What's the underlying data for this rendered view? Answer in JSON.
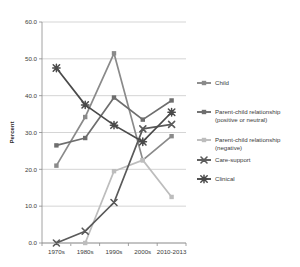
{
  "chart_data": {
    "type": "line",
    "title": "",
    "xlabel": "",
    "ylabel": "Percent",
    "categories": [
      "1970s",
      "1980s",
      "1990s",
      "2000s",
      "2010-2013"
    ],
    "ylim": [
      0.0,
      60.0
    ],
    "yticks": [
      "0.0",
      "10.0",
      "20.0",
      "30.0",
      "40.0",
      "50.0",
      "60.0"
    ],
    "ytick_values": [
      0.0,
      10.0,
      20.0,
      30.0,
      40.0,
      50.0,
      60.0
    ],
    "grid": true,
    "legend_position": "right",
    "series": [
      {
        "name": "Child",
        "values": [
          21.0,
          34.2,
          51.5,
          22.5,
          29.0
        ],
        "color": "#8a8a8a",
        "marker": "square"
      },
      {
        "name": "Parent-child relationship (positive or neutral)",
        "name_line1": "Parent-child relationship",
        "name_line2": "(positive or neutral)",
        "values": [
          26.5,
          28.5,
          39.5,
          33.5,
          38.7
        ],
        "color": "#6e6e6e",
        "marker": "square"
      },
      {
        "name": "Parent-child relationship (negative)",
        "name_line1": "Parent-child relationship",
        "name_line2": "(negative)",
        "values": [
          0.0,
          0.0,
          19.5,
          22.5,
          12.5
        ],
        "color": "#bdbdbd",
        "marker": "square"
      },
      {
        "name": "Care-support",
        "values": [
          0.0,
          3.2,
          11.0,
          31.0,
          32.2
        ],
        "color": "#5a5a5a",
        "marker": "x"
      },
      {
        "name": "Clinical",
        "values": [
          47.5,
          37.5,
          32.0,
          27.5,
          35.5
        ],
        "color": "#4a4a4a",
        "marker": "star"
      }
    ]
  },
  "legend": {
    "entries": [
      {
        "label": "Child"
      },
      {
        "label_line1": "Parent-child relationship",
        "label_line2": "(positive or neutral)"
      },
      {
        "label_line1": "Parent-child relationship",
        "label_line2": "(negative)"
      },
      {
        "label": "Care-support"
      },
      {
        "label": "Clinical"
      }
    ]
  }
}
